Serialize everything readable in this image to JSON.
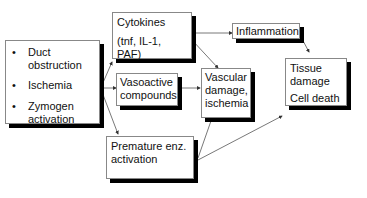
{
  "causes": [
    "Duct obstruction",
    "Ischemia",
    "Zymogen activation"
  ],
  "cytokines": {
    "line1": "Cytokines",
    "line2": "(tnf, IL-1, PAF)"
  },
  "vasoactive": "Vasoactive compounds",
  "premature": "Premature enz. activation",
  "vascular": "Vascular damage, ischemia",
  "inflammation": "Inflammation",
  "tissue": {
    "line1": "Tissue damage",
    "line2": "Cell death"
  }
}
